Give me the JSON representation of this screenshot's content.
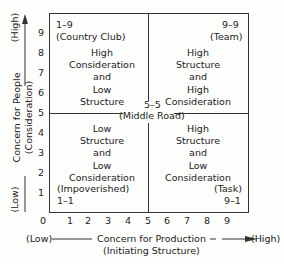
{
  "diagram": {
    "y_axis": {
      "high_label": "(High)",
      "low_label": "(Low)",
      "title": "Concern for People",
      "subtitle": "(Consideration)",
      "ticks": [
        "9",
        "8",
        "7",
        "6",
        "5",
        "4",
        "3",
        "2",
        "1"
      ]
    },
    "x_axis": {
      "low_label": "(Low)",
      "high_label": "(High)",
      "title": "Concern for Production",
      "subtitle": "(Initiating Structure)",
      "ticks": [
        "0",
        "1",
        "2",
        "3",
        "4",
        "5",
        "6",
        "7",
        "8",
        "9"
      ]
    },
    "quadrants": {
      "top_left": {
        "code": "1–9",
        "name": "(Country Club)",
        "lines": [
          "High",
          "Consideration",
          "and",
          "Low",
          "Structure"
        ]
      },
      "top_right": {
        "code": "9–9",
        "name": "(Team)",
        "lines": [
          "High",
          "Structure",
          "and",
          "High",
          "Consideration"
        ]
      },
      "bottom_left": {
        "code": "1–1",
        "name": "(Impoverished)",
        "lines": [
          "Low",
          "Structure",
          "and",
          "Low",
          "Consideration"
        ]
      },
      "bottom_right": {
        "code": "9–1",
        "name": "(Task)",
        "lines": [
          "High",
          "Structure",
          "and",
          "Low",
          "Consideration"
        ]
      }
    },
    "center": {
      "code": "5–5",
      "name": "(Middle Road)"
    }
  }
}
